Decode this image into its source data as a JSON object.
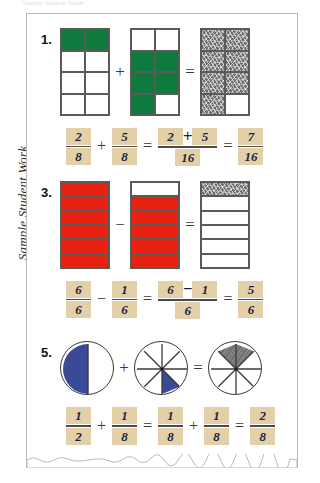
{
  "top_caption": "Sample Student Work",
  "side_label": "Sample Student Work",
  "colors": {
    "green": "#0f7a3d",
    "red": "#e8200f",
    "blue": "#3b4a96",
    "pencil_gray": "#6e6e6e",
    "tile_tan": "#e3cfa8",
    "digit_ink": "#241f45"
  },
  "problems": [
    {
      "number": "1.",
      "model_type": "rectangle-grid",
      "operator": "+",
      "equals": "=",
      "figures": [
        {
          "name": "grid-first-addend",
          "rows": 4,
          "cols": 2,
          "fills": [
            "green",
            "green",
            "none",
            "none",
            "none",
            "none",
            "none",
            "none"
          ]
        },
        {
          "name": "grid-second-addend",
          "rows": 4,
          "cols": 2,
          "fills": [
            "none",
            "none",
            "green",
            "green",
            "green",
            "green",
            "green",
            "none"
          ]
        },
        {
          "name": "grid-sum",
          "rows": 4,
          "cols": 2,
          "fills": [
            "pencil",
            "pencil",
            "pencil",
            "pencil",
            "pencil",
            "pencil",
            "pencil",
            "none"
          ]
        }
      ],
      "equation": {
        "a": {
          "num": "2",
          "den": "8"
        },
        "op1": "+",
        "b": {
          "num": "5",
          "den": "8"
        },
        "eq1": "=",
        "combined": {
          "num_left": "2",
          "num_op": "+",
          "num_right": "5",
          "den": "16"
        },
        "eq2": "=",
        "result": {
          "num": "7",
          "den": "16"
        }
      }
    },
    {
      "number": "3.",
      "model_type": "rectangle-grid",
      "operator": "−",
      "equals": "=",
      "figures": [
        {
          "name": "grid-minuend",
          "rows": 6,
          "cols": 1,
          "fills": [
            "red",
            "red",
            "red",
            "red",
            "red",
            "red"
          ]
        },
        {
          "name": "grid-subtrahend",
          "rows": 6,
          "cols": 1,
          "fills": [
            "none",
            "red",
            "red",
            "red",
            "red",
            "red"
          ]
        },
        {
          "name": "grid-difference",
          "rows": 6,
          "cols": 1,
          "fills": [
            "pencil",
            "none",
            "none",
            "none",
            "none",
            "none"
          ]
        }
      ],
      "equation": {
        "a": {
          "num": "6",
          "den": "6"
        },
        "op1": "−",
        "b": {
          "num": "1",
          "den": "6"
        },
        "eq1": "=",
        "combined": {
          "num_left": "6",
          "num_op": "−",
          "num_right": "1",
          "den": "6"
        },
        "eq2": "=",
        "result": {
          "num": "5",
          "den": "6"
        }
      }
    },
    {
      "number": "5.",
      "model_type": "circle",
      "operator": "+",
      "equals": "=",
      "figures": [
        {
          "name": "circle-first-addend",
          "slices": 2,
          "shaded": [
            0
          ],
          "shade_color": "blue"
        },
        {
          "name": "circle-second-addend",
          "slices": 8,
          "shaded": [
            5
          ],
          "shade_color": "blue"
        },
        {
          "name": "circle-sum",
          "slices": 8,
          "shaded": [
            6,
            7
          ],
          "shade_color": "pencil"
        }
      ],
      "equation": {
        "a": {
          "num": "1",
          "den": "2"
        },
        "op1": "+",
        "b": {
          "num": "1",
          "den": "8"
        },
        "eq1": "=",
        "c": {
          "num": "1",
          "den": "8"
        },
        "op2": "+",
        "d": {
          "num": "1",
          "den": "8"
        },
        "eq2": "=",
        "result": {
          "num": "2",
          "den": "8"
        }
      }
    }
  ]
}
